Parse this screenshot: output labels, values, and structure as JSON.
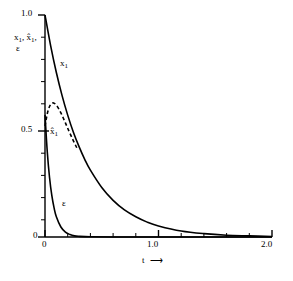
{
  "chart_data": {
    "type": "line",
    "title": "",
    "subtitle": "",
    "xlabel": "t",
    "ylabel": "x1, x1hat, epsilon",
    "xlim": [
      0,
      2.0
    ],
    "ylim": [
      0,
      1.0
    ],
    "grid": false,
    "legend": "inline-curve-labels",
    "x_ticks": [
      0,
      1.0,
      2.0
    ],
    "x_tick_labels": [
      "0",
      "1.0",
      "2.0"
    ],
    "x_minor_step": 0.2,
    "y_ticks": [
      0,
      0.5,
      1.0
    ],
    "y_tick_labels": [
      "0",
      "0.5",
      "1.0"
    ],
    "y_minor_step": 0.1,
    "series": [
      {
        "name": "x1",
        "style": "solid",
        "label": "x",
        "label_sub": "1",
        "x": [
          0,
          0.05,
          0.1,
          0.15,
          0.2,
          0.25,
          0.3,
          0.35,
          0.4,
          0.5,
          0.6,
          0.7,
          0.8,
          0.9,
          1.0,
          1.2,
          1.4,
          1.6,
          1.8,
          2.0
        ],
        "values": [
          1.0,
          0.861,
          0.741,
          0.638,
          0.549,
          0.472,
          0.407,
          0.35,
          0.301,
          0.223,
          0.165,
          0.122,
          0.091,
          0.067,
          0.05,
          0.027,
          0.015,
          0.008,
          0.005,
          0.002
        ]
      },
      {
        "name": "x1hat",
        "style": "dashed",
        "label": "x̂",
        "label_sub": "1",
        "x": [
          0,
          0.02,
          0.04,
          0.06,
          0.08,
          0.1,
          0.12,
          0.14,
          0.16,
          0.18,
          0.2,
          0.24,
          0.28
        ],
        "values": [
          0.5,
          0.555,
          0.588,
          0.602,
          0.603,
          0.594,
          0.578,
          0.559,
          0.537,
          0.514,
          0.49,
          0.444,
          0.402
        ]
      },
      {
        "name": "epsilon",
        "style": "solid",
        "label": "ε",
        "label_sub": "",
        "x": [
          0,
          0.02,
          0.04,
          0.06,
          0.08,
          0.1,
          0.14,
          0.18,
          0.22,
          0.26,
          0.3,
          0.4,
          0.6,
          1.0,
          1.5,
          2.0
        ],
        "values": [
          0.55,
          0.384,
          0.268,
          0.187,
          0.131,
          0.091,
          0.045,
          0.022,
          0.011,
          0.005,
          0.003,
          0.001,
          0.0,
          0.0,
          0.0,
          0.0
        ]
      }
    ],
    "annotations": [
      {
        "name": "x1-curve-label",
        "text": "x",
        "sub": "1"
      },
      {
        "name": "x1hat-curve-label",
        "text": "x̂",
        "sub": "1"
      },
      {
        "name": "epsilon-curve-label",
        "text": "ε",
        "sub": ""
      }
    ]
  },
  "axes": {
    "y_label_line1_base": "x",
    "y_label_line1_sub1": "1",
    "y_label_line1_mid": ", x̂",
    "y_label_line1_sub2": "1",
    "y_label_line1_end": ",",
    "y_label_line2": "ε",
    "x_title": "t",
    "x_arrow": "⟶"
  },
  "colors": {
    "background": "#ffffff",
    "axis": "#000000",
    "curve": "#000000",
    "text": "#000000"
  }
}
